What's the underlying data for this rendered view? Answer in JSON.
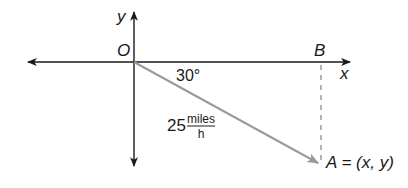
{
  "diagram": {
    "axes": {
      "x_label": "x",
      "y_label": "y",
      "origin_label": "O"
    },
    "points": {
      "B": {
        "label": "B"
      },
      "A": {
        "label": "A = (x, y)"
      }
    },
    "angle": {
      "label": "30°",
      "degrees": 30
    },
    "velocity": {
      "magnitude": "25",
      "unit_numerator": "miles",
      "unit_denominator": "h"
    },
    "colors": {
      "axis": "#1a1a1a",
      "vector": "#9a9a9a",
      "dashed": "#a0a0a0"
    }
  }
}
